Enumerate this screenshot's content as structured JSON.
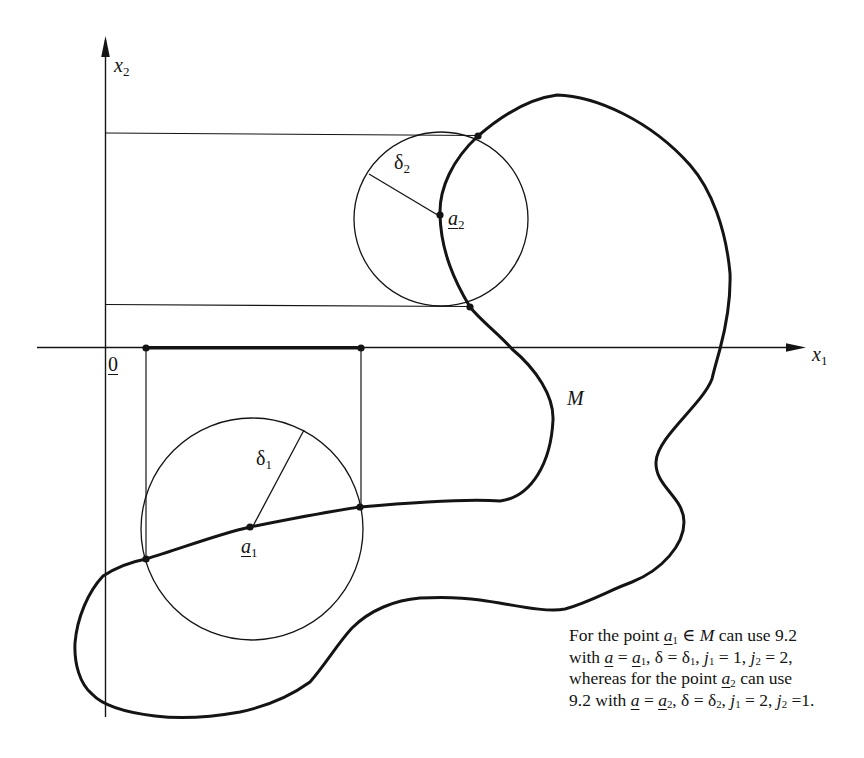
{
  "figure": {
    "axis_labels": {
      "x1": {
        "base": "x",
        "sub": "1"
      },
      "x2": {
        "base": "x",
        "sub": "2"
      }
    },
    "origin_label": "0",
    "set_label": "M",
    "point_labels": {
      "a1": {
        "base": "a",
        "sub": "1"
      },
      "a2": {
        "base": "a",
        "sub": "2"
      }
    },
    "radius_labels": {
      "delta1": {
        "base": "δ",
        "sub": "1"
      },
      "delta2": {
        "base": "δ",
        "sub": "2"
      }
    }
  },
  "caption": {
    "lines": [
      [
        {
          "t": "For the point ",
          "s": "p"
        },
        {
          "t": "a",
          "s": "iu"
        },
        {
          "t": "1",
          "s": "s"
        },
        {
          "t": " ∈ ",
          "s": "p"
        },
        {
          "t": "M",
          "s": "i"
        },
        {
          "t": " can use 9.2",
          "s": "p"
        }
      ],
      [
        {
          "t": "with ",
          "s": "p"
        },
        {
          "t": "a",
          "s": "iu"
        },
        {
          "t": " = ",
          "s": "p"
        },
        {
          "t": "a",
          "s": "iu"
        },
        {
          "t": "1",
          "s": "s"
        },
        {
          "t": ", δ = δ",
          "s": "p"
        },
        {
          "t": "1",
          "s": "s"
        },
        {
          "t": ", ",
          "s": "p"
        },
        {
          "t": "j",
          "s": "i"
        },
        {
          "t": "1",
          "s": "s"
        },
        {
          "t": " = 1, ",
          "s": "p"
        },
        {
          "t": "j",
          "s": "i"
        },
        {
          "t": "2",
          "s": "s"
        },
        {
          "t": " = 2,",
          "s": "p"
        }
      ],
      [
        {
          "t": "whereas for the point ",
          "s": "p"
        },
        {
          "t": "a",
          "s": "iu"
        },
        {
          "t": "2",
          "s": "s"
        },
        {
          "t": " can use",
          "s": "p"
        }
      ],
      [
        {
          "t": "9.2 with ",
          "s": "p"
        },
        {
          "t": "a",
          "s": "iu"
        },
        {
          "t": " = ",
          "s": "p"
        },
        {
          "t": "a",
          "s": "iu"
        },
        {
          "t": "2",
          "s": "s"
        },
        {
          "t": ", δ = δ",
          "s": "p"
        },
        {
          "t": "2",
          "s": "s"
        },
        {
          "t": ", ",
          "s": "p"
        },
        {
          "t": "j",
          "s": "i"
        },
        {
          "t": "1",
          "s": "s"
        },
        {
          "t": " = 2, ",
          "s": "p"
        },
        {
          "t": "j",
          "s": "i"
        },
        {
          "t": "2",
          "s": "s"
        },
        {
          "t": " =1.",
          "s": "p"
        }
      ]
    ]
  },
  "colors": {
    "ink": "#141414",
    "background": "#ffffff"
  }
}
